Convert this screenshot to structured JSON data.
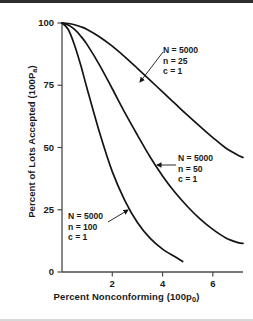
{
  "chart_data": {
    "type": "line",
    "title": "",
    "subtitle": "",
    "xlabel": "Percent Nonconforming (100p₀)",
    "xlabel_main": "Percent Nonconforming (100p",
    "xlabel_sub": "0",
    "xlabel_tail": ")",
    "ylabel": "Percent of Lots Accepted (100Pₐ)",
    "ylabel_main": "Percent of Lots Accepted (100P",
    "ylabel_sub": "a",
    "ylabel_tail": ")",
    "xlim": [
      0,
      7.2
    ],
    "ylim": [
      0,
      100
    ],
    "xticks": [
      2,
      4,
      6
    ],
    "xtick_labels": [
      "2",
      "4",
      "6"
    ],
    "yticks": [
      0,
      25,
      50,
      75,
      100
    ],
    "ytick_labels": [
      "0",
      "25",
      "50",
      "75",
      "100"
    ],
    "grid": false,
    "legend": "none",
    "line_color": "#141414",
    "axis_color": "#4a4a4a",
    "background": "#ffffff",
    "series": [
      {
        "name": "N = 5000, n = 25, c = 1",
        "N": 5000,
        "n": 25,
        "c": 1,
        "x": [
          0,
          0.25,
          0.5,
          0.75,
          1.0,
          1.5,
          2.0,
          2.5,
          3.0,
          3.5,
          4.0,
          4.5,
          5.0,
          5.5,
          6.0,
          6.5,
          7.0,
          7.2
        ],
        "values": [
          100,
          99.8,
          99.3,
          98.5,
          97.4,
          94.4,
          90.7,
          86.4,
          81.8,
          77.1,
          72.3,
          67.6,
          62.9,
          58.4,
          54.0,
          49.9,
          46.9,
          46.0
        ]
      },
      {
        "name": "N = 5000, n = 50, c = 1",
        "N": 5000,
        "n": 50,
        "c": 1,
        "x": [
          0,
          0.25,
          0.5,
          0.75,
          1.0,
          1.5,
          2.0,
          2.5,
          3.0,
          3.5,
          4.0,
          4.5,
          5.0,
          5.5,
          6.0,
          6.5,
          7.0,
          7.2
        ],
        "values": [
          100,
          99.2,
          97.4,
          94.7,
          91.3,
          83.0,
          73.6,
          64.0,
          55.0,
          46.3,
          38.6,
          31.9,
          26.2,
          21.2,
          17.1,
          13.8,
          11.8,
          11.5
        ]
      },
      {
        "name": "N = 5000, n = 100, c = 1",
        "N": 5000,
        "n": 100,
        "c": 1,
        "x": [
          0,
          0.25,
          0.5,
          0.75,
          1.0,
          1.5,
          2.0,
          2.5,
          3.0,
          3.5,
          4.0,
          4.5,
          4.8
        ],
        "values": [
          100,
          97.4,
          91.1,
          82.9,
          73.6,
          55.8,
          40.3,
          28.7,
          19.9,
          13.6,
          9.2,
          6.1,
          4.2
        ]
      }
    ],
    "annotations": [
      {
        "id": "annot-0",
        "lines": [
          "N = 5000",
          "n = 25",
          "c = 1"
        ],
        "pointer_from": [
          163,
          52
        ],
        "pointer_to": [
          140,
          82
        ]
      },
      {
        "id": "annot-1",
        "lines": [
          "N = 5000",
          "n = 50",
          "c = 1"
        ],
        "pointer_from": [
          176,
          165
        ],
        "pointer_to": [
          157,
          165
        ]
      },
      {
        "id": "annot-2",
        "lines": [
          "N = 5000",
          "n = 100",
          "c = 1"
        ],
        "pointer_from": [
          108,
          222
        ],
        "pointer_to": [
          128,
          210
        ]
      }
    ]
  }
}
